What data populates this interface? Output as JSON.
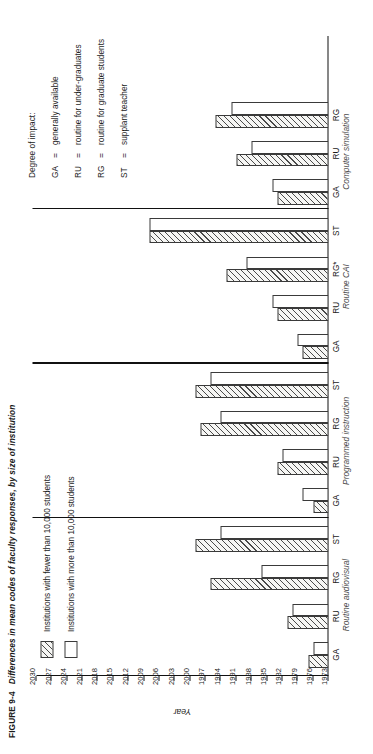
{
  "figure": {
    "number": "FIGURE 9-4",
    "caption": "Differences in mean codes of faculty responses, by size of institution"
  },
  "size_legend": {
    "items": [
      {
        "key": "small",
        "label": "Institutions with fewer than 10,000 students"
      },
      {
        "key": "large",
        "label": "Institutions with more than 10,000 students"
      }
    ]
  },
  "impact_key": {
    "heading": "Degree of impact:",
    "entries": [
      {
        "code": "GA",
        "eq": "=",
        "text": "generally available"
      },
      {
        "code": "RU",
        "eq": "=",
        "text": "routine for under-graduates"
      },
      {
        "code": "RG",
        "eq": "=",
        "text": "routine for graduate students"
      },
      {
        "code": "ST",
        "eq": "=",
        "text": "supplant teacher"
      }
    ]
  },
  "chart_data": {
    "type": "bar",
    "title": "Differences in mean codes of faculty responses, by size of institution",
    "xlabel": "",
    "ylabel": "Year",
    "ylim": [
      1973,
      2030
    ],
    "ytick_step": 3,
    "yticks": [
      1973,
      1976,
      1979,
      1982,
      1985,
      1988,
      1991,
      1994,
      1997,
      2000,
      2003,
      2006,
      2009,
      2012,
      2015,
      2018,
      2021,
      2024,
      2027,
      2030
    ],
    "grid": false,
    "legend_position": "upper-left",
    "series": [
      {
        "name": "Institutions with fewer than 10,000 students",
        "fill": "hatched"
      },
      {
        "name": "Institutions with more than 10,000 students",
        "fill": "white"
      }
    ],
    "groups": [
      {
        "name": "Routine audiovisual",
        "categories": [
          "GA",
          "RU",
          "RG",
          "ST"
        ],
        "values_small": [
          1977,
          1981,
          1996,
          1999
        ],
        "values_large": [
          1976,
          1980,
          1986,
          1994
        ]
      },
      {
        "name": "Programmed instruction",
        "categories": [
          "GA",
          "RU",
          "RG",
          "ST"
        ],
        "values_small": [
          1976,
          1983,
          1998,
          1999
        ],
        "values_large": [
          1978,
          1982,
          1994,
          1996
        ]
      },
      {
        "name": "Routine CAI",
        "categories": [
          "GA",
          "RU",
          "RG*",
          "ST"
        ],
        "values_small": [
          1978,
          1983,
          1993,
          2008
        ],
        "values_large": [
          1979,
          1984,
          1989,
          2008
        ]
      },
      {
        "name": "Computer simulation",
        "categories": [
          "GA",
          "RU",
          "RG"
        ],
        "values_small": [
          1983,
          1991,
          1995
        ],
        "values_large": [
          1984,
          1988,
          1992
        ]
      }
    ]
  }
}
